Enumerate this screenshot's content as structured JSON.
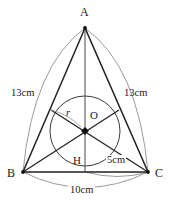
{
  "figure": {
    "type": "geometry-diagram",
    "stroke_color": "#2b2b2b",
    "arc_color": "#8a8a8a",
    "background": "#ffffff",
    "vertices": [
      {
        "id": "A",
        "label": "A",
        "x": 85,
        "y": 28
      },
      {
        "id": "B",
        "label": "B",
        "x": 23,
        "y": 172
      },
      {
        "id": "C",
        "label": "C",
        "x": 148,
        "y": 172
      }
    ],
    "points": [
      {
        "id": "O",
        "label": "O",
        "x": 85,
        "y": 131,
        "role": "incenter"
      },
      {
        "id": "H",
        "label": "H",
        "x": 85,
        "y": 172,
        "role": "foot-of-altitude"
      }
    ],
    "incircle": {
      "cx": 85,
      "cy": 131,
      "r": 35
    },
    "labels": {
      "vertex_a": "A",
      "vertex_b": "B",
      "vertex_c": "C",
      "incenter": "O",
      "foot": "H",
      "radius": "r",
      "side_ab": "13cm",
      "side_ac": "13cm",
      "half_base": "5cm",
      "base": "10cm"
    }
  }
}
